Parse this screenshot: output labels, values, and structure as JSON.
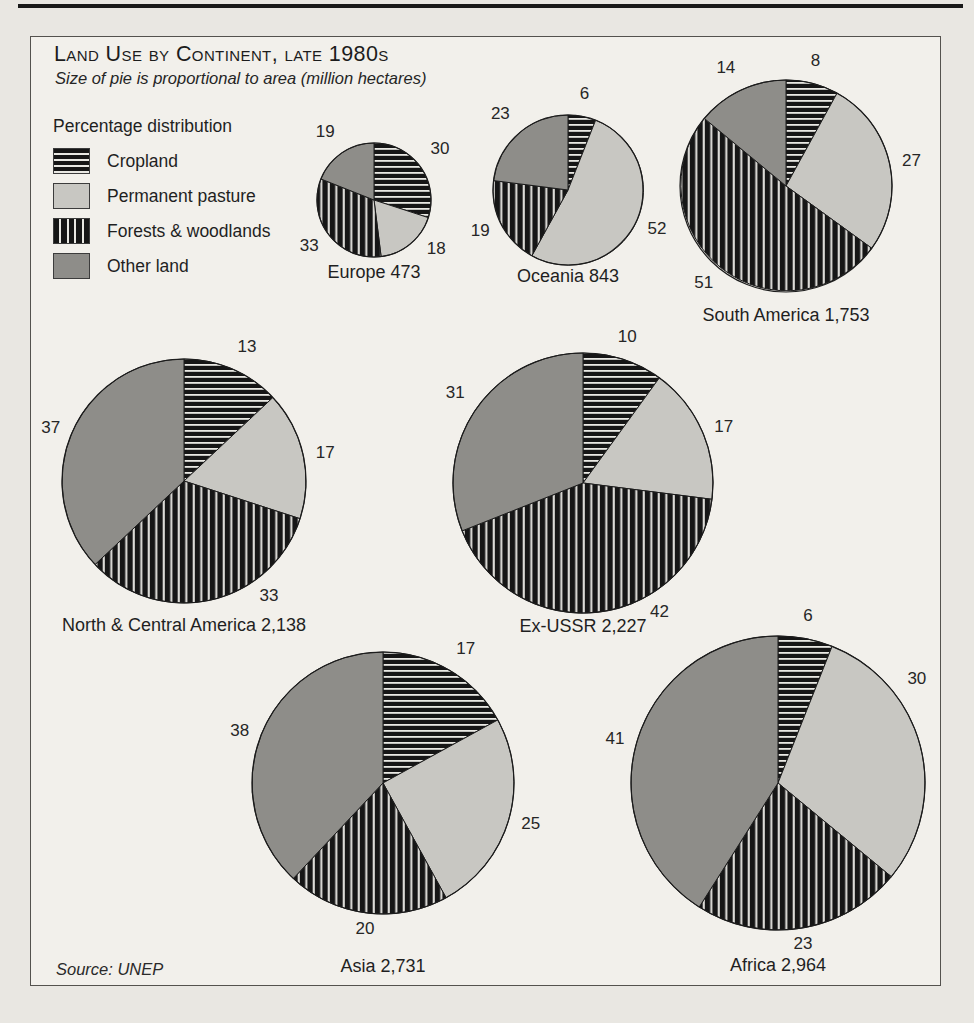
{
  "header": {
    "title": "Land Use by Continent, late 1980s",
    "subtitle": "Size of pie is proportional to area (million hectares)"
  },
  "legend": {
    "title": "Percentage distribution",
    "position": "top-left",
    "items": [
      {
        "key": "cropland",
        "label": "Cropland",
        "pattern": "h-stripes"
      },
      {
        "key": "pasture",
        "label": "Permanent pasture",
        "pattern": "solid-light"
      },
      {
        "key": "forests",
        "label": "Forests & woodlands",
        "pattern": "v-stripes"
      },
      {
        "key": "other",
        "label": "Other land",
        "pattern": "solid-mid"
      }
    ]
  },
  "source": "Source: UNEP",
  "colors": {
    "background": "#e9e7e2",
    "panel": "#f2f0eb",
    "ink": "#1a1a1a",
    "outline": "#1c1c1c",
    "pasture": "#c8c7c2",
    "other": "#8e8d89",
    "stripe_light": "#e9e8e3"
  },
  "chart_data": {
    "type": "pie",
    "title": "Land Use by Continent, late 1980s",
    "note": "Size of pie is proportional to area (million hectares)",
    "unit": "percent",
    "area_unit": "million hectares",
    "categories": [
      "Cropland",
      "Permanent pasture",
      "Forests & woodlands",
      "Other land"
    ],
    "category_patterns": [
      "h-stripes",
      "solid-light",
      "v-stripes",
      "solid-mid"
    ],
    "pies": [
      {
        "key": "europe",
        "name": "Europe",
        "area_mha": 473,
        "area_label": "473",
        "values": [
          30,
          18,
          33,
          19
        ],
        "cx": 374,
        "cy": 200,
        "r": 57,
        "caption_y": 278,
        "label_angles": [
          null,
          131,
          null,
          null
        ]
      },
      {
        "key": "oceania",
        "name": "Oceania",
        "area_mha": 843,
        "area_label": "843",
        "values": [
          6,
          52,
          19,
          23
        ],
        "cx": 568,
        "cy": 190,
        "r": 75,
        "caption_y": 282,
        "label_angles": [
          null,
          null,
          null,
          null
        ]
      },
      {
        "key": "south-america",
        "name": "South America",
        "area_mha": 1753,
        "area_label": "1,753",
        "values": [
          8,
          27,
          51,
          14
        ],
        "cx": 786,
        "cy": 186,
        "r": 106,
        "caption_y": 321,
        "label_angles": [
          null,
          null,
          null,
          null
        ]
      },
      {
        "key": "north-central-america",
        "name": "North & Central America",
        "area_mha": 2138,
        "area_label": "2,138",
        "values": [
          13,
          17,
          33,
          37
        ],
        "cx": 184,
        "cy": 481,
        "r": 122,
        "caption_y": 631,
        "label_angles": [
          null,
          null,
          146,
          null
        ]
      },
      {
        "key": "ex-ussr",
        "name": "Ex-USSR",
        "area_mha": 2227,
        "area_label": "2,227",
        "values": [
          10,
          17,
          42,
          31
        ],
        "cx": 583,
        "cy": 483,
        "r": 130,
        "caption_y": 632,
        "label_angles": [
          null,
          null,
          152,
          null
        ]
      },
      {
        "key": "asia",
        "name": "Asia",
        "area_mha": 2731,
        "area_label": "2,731",
        "values": [
          17,
          25,
          20,
          38
        ],
        "cx": 383,
        "cy": 783,
        "r": 131,
        "caption_y": 972,
        "label_angles": [
          null,
          null,
          null,
          null
        ]
      },
      {
        "key": "africa",
        "name": "Africa",
        "area_mha": 2964,
        "area_label": "2,964",
        "values": [
          6,
          30,
          23,
          41
        ],
        "cx": 778,
        "cy": 783,
        "r": 147,
        "caption_y": 971,
        "label_angles": [
          null,
          54,
          null,
          null
        ]
      }
    ]
  }
}
